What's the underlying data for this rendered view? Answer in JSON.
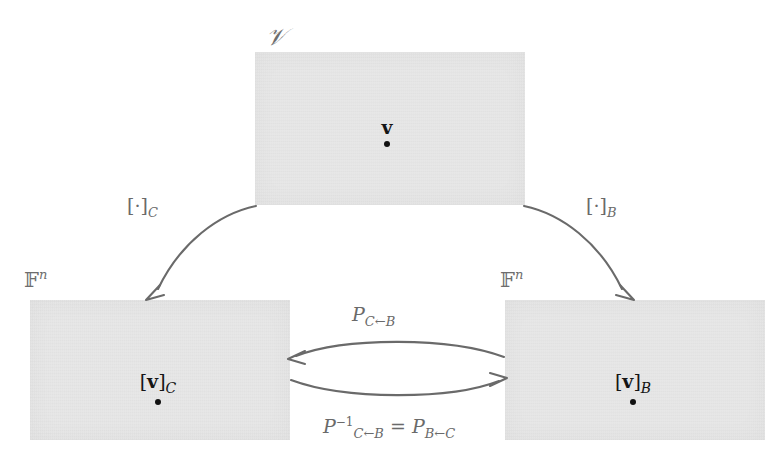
{
  "diagram": {
    "background_color": "#ffffff",
    "box_fill_color": "#e7e7e7",
    "arrow_color": "#6a6a6a",
    "text_color": "#6d6d6d",
    "point_color": "#151515"
  },
  "spaces": [
    {
      "id": "v",
      "label": "𝒱",
      "label_plain": "V",
      "point_label_prefix": "",
      "point_label_vector": "v",
      "point_label_subscript": "",
      "has_brackets": false
    },
    {
      "id": "f-c",
      "label_base": "𝔽",
      "label_exponent": "n",
      "label_plain": "F^n",
      "point_label_open": "[",
      "point_label_vector": "v",
      "point_label_close": "]",
      "point_label_subscript": "C",
      "has_brackets": true
    },
    {
      "id": "f-b",
      "label_base": "𝔽",
      "label_exponent": "n",
      "label_plain": "F^n",
      "point_label_open": "[",
      "point_label_vector": "v",
      "point_label_close": "]",
      "point_label_subscript": "B",
      "has_brackets": true
    }
  ],
  "arrows": [
    {
      "id": "coord-map-c",
      "from": "v",
      "to": "f-c",
      "direction": "down-left",
      "label_open": "[",
      "label_dot": "·",
      "label_close": "]",
      "label_subscript": "C",
      "label_plain": "[ · ]_C"
    },
    {
      "id": "coord-map-b",
      "from": "v",
      "to": "f-b",
      "direction": "down-right",
      "label_open": "[",
      "label_dot": "·",
      "label_close": "]",
      "label_subscript": "B",
      "label_plain": "[ · ]_B"
    },
    {
      "id": "change-of-basis-c-from-b",
      "from": "f-b",
      "to": "f-c",
      "direction": "left",
      "label_base": "P",
      "label_subscript": "C←B",
      "label_plain": "P_{C←B}"
    },
    {
      "id": "change-of-basis-b-from-c",
      "from": "f-c",
      "to": "f-b",
      "direction": "right",
      "label_base": "P",
      "label_superscript": "−1",
      "label_subscript": "C←B",
      "label_equals": "=",
      "label_base2": "P",
      "label_subscript2": "B←C",
      "label_plain": "P^{-1}_{C←B} = P_{B←C}"
    }
  ]
}
